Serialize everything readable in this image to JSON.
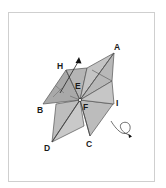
{
  "figure": {
    "type": "fold-diagram",
    "labels": {
      "A": "A",
      "B": "B",
      "C": "C",
      "D": "D",
      "E": "E",
      "F": "F",
      "H": "H",
      "I": "I"
    },
    "colors": {
      "fill_light": "#c8c8c8",
      "fill_mid": "#b4b4b4",
      "fill_dark": "#a4a4a4",
      "stroke": "#4a4a4a",
      "border": "#cfcfcf"
    }
  }
}
